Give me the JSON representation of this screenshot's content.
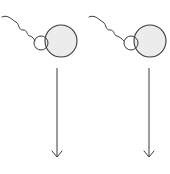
{
  "diagram": {
    "colors": {
      "stroke": "#3a3a3a",
      "egg_fill": "#ececec",
      "background": "#ffffff"
    },
    "panels": [
      {
        "id": "left",
        "egg": {
          "cx": 61,
          "cy": 41,
          "r": 16
        },
        "sperm_head": {
          "cx": 41,
          "cy": 43,
          "r": 7
        },
        "tail_path": "M2,17 C8,14 12,20 16,22 C20,25 18,30 23,30 C28,30 26,35 30,36 C33,37 34,39 35,41",
        "arrow": {
          "x": 57,
          "y1": 68,
          "y2": 157
        }
      },
      {
        "id": "right",
        "egg": {
          "cx": 150,
          "cy": 41,
          "r": 16
        },
        "sperm_head": {
          "cx": 131,
          "cy": 43,
          "r": 7
        },
        "tail_path": "M89,17 C95,14 99,20 103,22 C107,25 105,30 110,30 C115,30 113,35 117,36 C120,37 122,39 124,41",
        "arrow": {
          "x": 149,
          "y1": 68,
          "y2": 157
        }
      }
    ]
  }
}
